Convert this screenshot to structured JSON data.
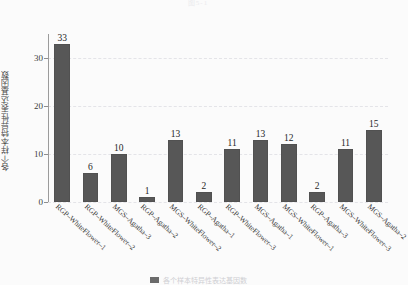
{
  "figure": {
    "title": "图5-1",
    "legend_label": "各个样本特异性表达基因数"
  },
  "axes": {
    "ylabel": "各个样本特异性表达基因数",
    "xlabel": "",
    "yticks": [
      "0",
      "10",
      "20",
      "30"
    ]
  },
  "colors": {
    "bar": "#575757",
    "grid": "#e3e3e8",
    "axis": "#9b9b9b",
    "background": "#fbfbfb"
  },
  "chart_data": {
    "type": "bar",
    "title": "图5-1",
    "xlabel": "",
    "ylabel": "各个样本特异性表达基因数",
    "ylim": [
      0,
      35
    ],
    "yticks": [
      0,
      10,
      20,
      30
    ],
    "grid": true,
    "legend": "bottom",
    "categories": [
      "RGP–WhiteFlower–1",
      "RGP–WhiteFlower–2",
      "MGS–Agatha–3",
      "RGP–Agatha–2",
      "MGS–WhiteFlower–2",
      "RGP–Agatha–1",
      "RGP–WhiteFlower–3",
      "MGS–Agatha–1",
      "MGS–WhiteFlower–1",
      "RGP–Agatha–3",
      "MGS–WhiteFlower–3",
      "MGS–Agatha–2"
    ],
    "values": [
      33,
      6,
      10,
      1,
      13,
      2,
      11,
      13,
      12,
      2,
      11,
      15
    ],
    "data_labels": [
      "33",
      "6",
      "10",
      "1",
      "13",
      "2",
      "11",
      "13",
      "12",
      "2",
      "11",
      "15"
    ]
  }
}
